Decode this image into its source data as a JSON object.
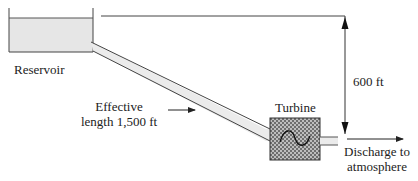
{
  "diagram": {
    "type": "hydro-power schematic",
    "labels": {
      "reservoir": "Reservoir",
      "head": "600 ft",
      "pipe_line1": "Effective",
      "pipe_line2": "length 1,500 ft",
      "turbine": "Turbine",
      "discharge_line1": "Discharge to",
      "discharge_line2": "atmosphere"
    },
    "values": {
      "head_ft": 600,
      "effective_length_ft": 1500
    },
    "colors": {
      "line": "#333333",
      "water_fill": "#e6e6e6",
      "pipe_fill": "#ebebeb",
      "turbine_fill": "#8a8a8a"
    }
  }
}
